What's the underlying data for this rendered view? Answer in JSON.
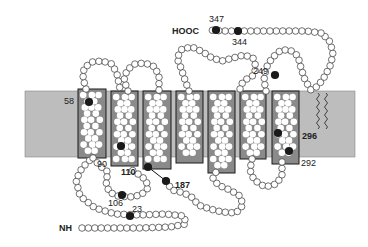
{
  "diagram": {
    "type": "transmembrane-protein-topology",
    "helix_count": 7,
    "colors": {
      "membrane": "#bdbdbd",
      "helix_fill": "#8a8a8a",
      "helix_stroke": "#1a1a1a",
      "residue_fill": "#ffffff",
      "residue_stroke": "#333333",
      "marked_residue": "#1a1a1a",
      "background": "#ffffff"
    },
    "membrane": {
      "x": 25,
      "y": 91,
      "width": 330,
      "height": 66
    },
    "termini": {
      "n_terminus": {
        "label": "NH",
        "x": 59,
        "y": 228
      },
      "c_terminus": {
        "label": "HOOC",
        "x": 172,
        "y": 31
      }
    },
    "helices": [
      {
        "id": "TM1",
        "x": 78,
        "y": 89,
        "w": 28,
        "h": 69
      },
      {
        "id": "TM2",
        "x": 111,
        "y": 91,
        "w": 27,
        "h": 75
      },
      {
        "id": "TM3",
        "x": 143,
        "y": 91,
        "w": 28,
        "h": 78
      },
      {
        "id": "TM4",
        "x": 176,
        "y": 91,
        "w": 27,
        "h": 72
      },
      {
        "id": "TM5",
        "x": 208,
        "y": 91,
        "w": 27,
        "h": 82
      },
      {
        "id": "TM6",
        "x": 240,
        "y": 91,
        "w": 26,
        "h": 68
      },
      {
        "id": "TM7",
        "x": 272,
        "y": 91,
        "w": 27,
        "h": 73
      }
    ],
    "marked_residues": [
      {
        "number": "347",
        "cx": 216,
        "cy": 30,
        "label_x": 209,
        "label_y": 22,
        "bold": false
      },
      {
        "number": "344",
        "cx": 238,
        "cy": 31,
        "label_x": 232,
        "label_y": 45,
        "bold": false
      },
      {
        "number": "249",
        "cx": 275,
        "cy": 75,
        "label_x": 253,
        "label_y": 74,
        "bold": false
      },
      {
        "number": "58",
        "cx": 89,
        "cy": 102,
        "label_x": 64,
        "label_y": 104,
        "bold": false
      },
      {
        "number": "110",
        "cx": 121,
        "cy": 146,
        "label_x": 121,
        "label_y": 175,
        "bold": true
      },
      {
        "number": "90",
        "cx": null,
        "cy": null,
        "label_x": 97,
        "label_y": 167,
        "bold": false
      },
      {
        "number": "187",
        "cx": 166,
        "cy": 181,
        "label_x": 175,
        "label_y": 188,
        "bold": true
      },
      {
        "number": "106",
        "cx": 122,
        "cy": 195,
        "label_x": 108,
        "label_y": 206,
        "bold": false
      },
      {
        "number": "23",
        "cx": 130,
        "cy": 216,
        "label_x": 132,
        "label_y": 212,
        "bold": false
      },
      {
        "number": "296",
        "cx": 278,
        "cy": 133,
        "label_x": 302,
        "label_y": 139,
        "bold": true
      },
      {
        "number": "292",
        "cx": 289,
        "cy": 151,
        "label_x": 301,
        "label_y": 166,
        "bold": false
      }
    ],
    "extra_dark_dots": [
      {
        "cx": 148,
        "cy": 167
      }
    ],
    "disulfide_line": {
      "x1": 148,
      "y1": 167,
      "x2": 166,
      "y2": 181
    },
    "loops": [
      {
        "name": "n-terminal-tail",
        "points": [
          [
            82,
            228
          ],
          [
            110,
            228
          ],
          [
            140,
            228
          ],
          [
            170,
            227
          ],
          [
            186,
            224
          ],
          [
            184,
            216
          ],
          [
            165,
            214
          ],
          [
            140,
            215
          ],
          [
            115,
            214
          ],
          [
            95,
            208
          ],
          [
            80,
            196
          ],
          [
            76,
            180
          ],
          [
            82,
            168
          ],
          [
            90,
            160
          ]
        ]
      },
      {
        "name": "extracellular-loop-1",
        "points": [
          [
            86,
            89
          ],
          [
            83,
            78
          ],
          [
            84,
            68
          ],
          [
            92,
            62
          ],
          [
            102,
            61
          ],
          [
            112,
            64
          ],
          [
            117,
            74
          ],
          [
            120,
            89
          ]
        ]
      },
      {
        "name": "intracellular-loop-1",
        "points": [
          [
            93,
            158
          ],
          [
            100,
            166
          ],
          [
            108,
            172
          ],
          [
            106,
            182
          ],
          [
            109,
            192
          ],
          [
            118,
            196
          ],
          [
            130,
            197
          ],
          [
            141,
            195
          ],
          [
            148,
            188
          ],
          [
            146,
            180
          ],
          [
            138,
            174
          ],
          [
            129,
            168
          ]
        ]
      },
      {
        "name": "extracellular-loop-2",
        "points": [
          [
            128,
            91
          ],
          [
            124,
            80
          ],
          [
            127,
            70
          ],
          [
            135,
            64
          ],
          [
            145,
            63
          ],
          [
            155,
            67
          ],
          [
            159,
            77
          ],
          [
            159,
            91
          ]
        ]
      },
      {
        "name": "intracellular-loop-2",
        "points": [
          [
            166,
            181
          ],
          [
            172,
            190
          ],
          [
            184,
            193
          ],
          [
            193,
            198
          ],
          [
            198,
            205
          ],
          [
            210,
            209
          ],
          [
            222,
            212
          ],
          [
            236,
            213
          ],
          [
            243,
            205
          ],
          [
            240,
            196
          ],
          [
            230,
            190
          ],
          [
            218,
            185
          ],
          [
            213,
            178
          ],
          [
            217,
            170
          ]
        ]
      },
      {
        "name": "extracellular-loop-3",
        "points": [
          [
            189,
            91
          ],
          [
            185,
            80
          ],
          [
            181,
            68
          ],
          [
            177,
            58
          ],
          [
            182,
            49
          ],
          [
            192,
            47
          ],
          [
            203,
            52
          ],
          [
            212,
            58
          ],
          [
            222,
            61
          ],
          [
            233,
            58
          ],
          [
            244,
            55
          ],
          [
            253,
            58
          ],
          [
            256,
            67
          ],
          [
            254,
            75
          ],
          [
            245,
            80
          ],
          [
            240,
            86
          ],
          [
            240,
            91
          ]
        ]
      },
      {
        "name": "intracellular-loop-3",
        "points": [
          [
            252,
            159
          ],
          [
            250,
            170
          ],
          [
            254,
            180
          ],
          [
            265,
            187
          ],
          [
            276,
            184
          ],
          [
            282,
            176
          ],
          [
            282,
            166
          ],
          [
            282,
            160
          ]
        ]
      },
      {
        "name": "extracellular-loop-4",
        "points": [
          [
            266,
            91
          ],
          [
            264,
            80
          ],
          [
            266,
            68
          ],
          [
            272,
            58
          ],
          [
            281,
            50
          ],
          [
            290,
            50
          ],
          [
            298,
            56
          ],
          [
            301,
            68
          ],
          [
            305,
            80
          ],
          [
            311,
            90
          ],
          [
            318,
            86
          ],
          [
            325,
            76
          ],
          [
            331,
            64
          ],
          [
            333,
            52
          ],
          [
            329,
            40
          ],
          [
            321,
            33
          ]
        ]
      },
      {
        "name": "c-terminal-tail",
        "points": [
          [
            321,
            33
          ],
          [
            306,
            31
          ],
          [
            290,
            31
          ],
          [
            272,
            31
          ],
          [
            255,
            31
          ],
          [
            238,
            31
          ],
          [
            224,
            31
          ],
          [
            208,
            30
          ]
        ]
      }
    ],
    "lipid_anchors": [
      {
        "x": 318,
        "y1": 93,
        "y2": 127
      },
      {
        "x": 326,
        "y1": 93,
        "y2": 127
      }
    ],
    "residue_radius": 3.3
  }
}
